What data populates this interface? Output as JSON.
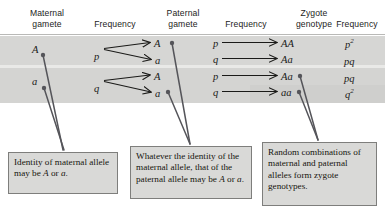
{
  "figure": {
    "band_color": "#d6d6d4",
    "box_fill": "#d9d9d7",
    "box_border": "#7e7e7c",
    "ink": "#1a1a18"
  },
  "headers": [
    {
      "id": "maternal-gamete",
      "line1": "Maternal",
      "line2": "gamete"
    },
    {
      "id": "frequency-1",
      "line1": "",
      "line2": "Frequency"
    },
    {
      "id": "paternal-gamete",
      "line1": "Paternal",
      "line2": "gamete"
    },
    {
      "id": "frequency-2",
      "line1": "",
      "line2": "Frequency"
    },
    {
      "id": "zygote-genotype",
      "line1": "Zygote",
      "line2": "genotype"
    },
    {
      "id": "frequency-3",
      "line1": "",
      "line2": "Frequency"
    }
  ],
  "maternal": [
    {
      "allele": "A",
      "frequency": "p"
    },
    {
      "allele": "a",
      "frequency": "q"
    }
  ],
  "rows": [
    {
      "maternal_allele": "A",
      "maternal_frequency": "p",
      "entries": [
        {
          "paternal_allele": "A",
          "paternal_frequency": "p",
          "zygote": "AA",
          "zygote_freq_base": "p",
          "zygote_freq_sup": "2"
        },
        {
          "paternal_allele": "a",
          "paternal_frequency": "q",
          "zygote": "Aa",
          "zygote_freq_base": "pq",
          "zygote_freq_sup": ""
        }
      ]
    },
    {
      "maternal_allele": "a",
      "maternal_frequency": "q",
      "entries": [
        {
          "paternal_allele": "A",
          "paternal_frequency": "p",
          "zygote": "Aa",
          "zygote_freq_base": "pq",
          "zygote_freq_sup": ""
        },
        {
          "paternal_allele": "a",
          "paternal_frequency": "q",
          "zygote": "aa",
          "zygote_freq_base": "q",
          "zygote_freq_sup": "2"
        }
      ]
    }
  ],
  "captions": {
    "maternal": {
      "id": "caption-maternal-allele",
      "segments": [
        {
          "text": "Identity of maternal allele may be ",
          "italic": false
        },
        {
          "text": "A",
          "italic": true
        },
        {
          "text": " or ",
          "italic": false
        },
        {
          "text": "a",
          "italic": true
        },
        {
          "text": ".",
          "italic": false
        }
      ]
    },
    "paternal": {
      "id": "caption-paternal-allele",
      "segments": [
        {
          "text": "Whatever the identity of the maternal allele, that of the paternal allele may be ",
          "italic": false
        },
        {
          "text": "A",
          "italic": true
        },
        {
          "text": " or ",
          "italic": false
        },
        {
          "text": "a",
          "italic": true
        },
        {
          "text": ".",
          "italic": false
        }
      ]
    },
    "zygote": {
      "id": "caption-zygote-genotype",
      "segments": [
        {
          "text": "Random combinations of maternal and paternal alleles form zygote genotypes.",
          "italic": false
        }
      ]
    }
  }
}
